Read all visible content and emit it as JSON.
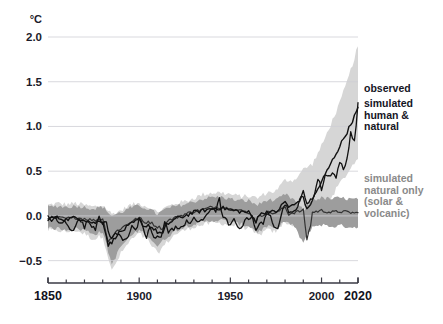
{
  "chart_data": {
    "type": "line",
    "title": "",
    "xlabel": "",
    "ylabel": "°C",
    "unit_label": "°C",
    "xlim": [
      1850,
      2020
    ],
    "ylim": [
      -0.75,
      2.0
    ],
    "grid": true,
    "grid_axis": "y",
    "legend_position": "right-inline",
    "x_ticks_major": [
      1850,
      1900,
      1950,
      2000,
      2020
    ],
    "x_tick_labels": [
      "1850",
      "1900",
      "1950",
      "2000",
      "2020"
    ],
    "x_ticks_minor_step": 10,
    "y_ticks": [
      -0.5,
      0.0,
      0.5,
      1.0,
      1.5,
      2.0
    ],
    "y_tick_labels": [
      "-0.5",
      "0.0",
      "0.5",
      "1.0",
      "1.5",
      "2.0"
    ],
    "colors": {
      "observed_line": "#111111",
      "human_natural_line": "#111111",
      "natural_only_line": "#333333",
      "human_natural_band": "#d6d6d6",
      "natural_only_band": "#9d9d9d",
      "gridline": "#cfcfd6",
      "axis": "#3a3a44",
      "legend_dark_text": "#15151f",
      "legend_gray_text": "#8a8a8a"
    },
    "annotations": [
      {
        "name": "observed",
        "text": "observed",
        "x": 2021,
        "y": 1.28,
        "color": "#15151f"
      },
      {
        "name": "simulated-human-natural",
        "text": "simulated\nhuman &\nnatural",
        "x": 2021,
        "y": 1.1,
        "color": "#15151f"
      },
      {
        "name": "simulated-natural-only",
        "text": "simulated\nnatural only\n(solar &\nvolcanic)",
        "x": 2021,
        "y": 0.15,
        "color": "#8a8a8a"
      }
    ],
    "x": [
      1850,
      1855,
      1860,
      1865,
      1870,
      1875,
      1880,
      1885,
      1890,
      1895,
      1900,
      1905,
      1910,
      1915,
      1920,
      1925,
      1930,
      1935,
      1940,
      1945,
      1950,
      1955,
      1960,
      1965,
      1970,
      1975,
      1980,
      1985,
      1990,
      1995,
      2000,
      2005,
      2010,
      2015,
      2020
    ],
    "series": [
      {
        "name": "observed",
        "label": "observed",
        "values": [
          -0.02,
          -0.05,
          -0.08,
          -0.04,
          -0.12,
          -0.14,
          -0.1,
          -0.22,
          -0.2,
          -0.16,
          -0.05,
          -0.22,
          -0.25,
          -0.08,
          -0.14,
          -0.12,
          -0.04,
          -0.06,
          0.1,
          0.04,
          -0.12,
          -0.1,
          -0.02,
          -0.12,
          0.0,
          -0.06,
          0.14,
          0.06,
          0.26,
          0.28,
          0.3,
          0.54,
          0.62,
          0.9,
          1.26
        ]
      },
      {
        "name": "simulated_human_natural",
        "label": "simulated human & natural",
        "values": [
          -0.03,
          -0.02,
          -0.04,
          -0.02,
          -0.04,
          -0.08,
          -0.05,
          -0.3,
          -0.18,
          -0.1,
          -0.04,
          -0.1,
          -0.18,
          -0.1,
          -0.03,
          0.0,
          0.04,
          0.06,
          0.08,
          0.09,
          0.07,
          0.05,
          0.04,
          0.0,
          0.05,
          0.04,
          0.16,
          0.12,
          0.22,
          0.18,
          0.38,
          0.58,
          0.78,
          0.98,
          1.2
        ]
      },
      {
        "name": "simulated_natural_only",
        "label": "simulated natural only (solar & volcanic)",
        "values": [
          -0.02,
          -0.02,
          -0.03,
          -0.02,
          -0.03,
          -0.05,
          -0.03,
          -0.26,
          -0.14,
          -0.07,
          -0.02,
          -0.06,
          -0.12,
          -0.06,
          -0.02,
          0.02,
          0.05,
          0.07,
          0.1,
          0.1,
          0.08,
          0.06,
          0.04,
          -0.02,
          0.04,
          0.03,
          0.1,
          0.04,
          -0.1,
          0.04,
          0.06,
          0.04,
          0.05,
          0.04,
          0.03
        ]
      }
    ],
    "bands": [
      {
        "name": "human_natural_range",
        "for_series": "simulated_human_natural",
        "color": "#d6d6d6",
        "upper": [
          0.12,
          0.14,
          0.13,
          0.14,
          0.12,
          0.1,
          0.12,
          0.02,
          0.06,
          0.12,
          0.14,
          0.1,
          0.04,
          0.1,
          0.14,
          0.16,
          0.2,
          0.24,
          0.26,
          0.26,
          0.24,
          0.22,
          0.22,
          0.2,
          0.26,
          0.28,
          0.4,
          0.4,
          0.52,
          0.58,
          0.78,
          1.02,
          1.26,
          1.56,
          1.9
        ],
        "lower": [
          -0.16,
          -0.16,
          -0.18,
          -0.16,
          -0.2,
          -0.26,
          -0.22,
          -0.62,
          -0.42,
          -0.28,
          -0.2,
          -0.28,
          -0.42,
          -0.3,
          -0.2,
          -0.16,
          -0.12,
          -0.1,
          -0.08,
          -0.08,
          -0.1,
          -0.12,
          -0.14,
          -0.22,
          -0.16,
          -0.18,
          -0.06,
          -0.12,
          -0.06,
          -0.14,
          0.04,
          0.2,
          0.36,
          0.5,
          0.66
        ]
      },
      {
        "name": "natural_only_range",
        "for_series": "simulated_natural_only",
        "color": "#9d9d9d",
        "upper": [
          0.1,
          0.11,
          0.1,
          0.11,
          0.1,
          0.08,
          0.1,
          0.0,
          0.04,
          0.09,
          0.11,
          0.08,
          0.02,
          0.08,
          0.11,
          0.13,
          0.16,
          0.19,
          0.21,
          0.21,
          0.19,
          0.17,
          0.17,
          0.12,
          0.18,
          0.17,
          0.24,
          0.18,
          0.06,
          0.18,
          0.2,
          0.19,
          0.2,
          0.19,
          0.18
        ],
        "lower": [
          -0.14,
          -0.14,
          -0.15,
          -0.14,
          -0.16,
          -0.2,
          -0.18,
          -0.54,
          -0.34,
          -0.23,
          -0.16,
          -0.22,
          -0.34,
          -0.24,
          -0.16,
          -0.12,
          -0.09,
          -0.07,
          -0.05,
          -0.05,
          -0.07,
          -0.09,
          -0.11,
          -0.18,
          -0.12,
          -0.14,
          -0.06,
          -0.12,
          -0.3,
          -0.12,
          -0.1,
          -0.12,
          -0.11,
          -0.12,
          -0.13
        ]
      }
    ],
    "series_detail": {
      "observed_dense": [
        [
          1850,
          -0.02
        ],
        [
          1852,
          -0.04
        ],
        [
          1854,
          -0.03
        ],
        [
          1856,
          -0.09
        ],
        [
          1858,
          -0.06
        ],
        [
          1860,
          -0.08
        ],
        [
          1862,
          -0.16
        ],
        [
          1864,
          -0.14
        ],
        [
          1866,
          -0.05
        ],
        [
          1868,
          -0.06
        ],
        [
          1870,
          -0.12
        ],
        [
          1872,
          -0.06
        ],
        [
          1874,
          -0.1
        ],
        [
          1876,
          -0.14
        ],
        [
          1878,
          0.02
        ],
        [
          1880,
          -0.1
        ],
        [
          1882,
          -0.08
        ],
        [
          1884,
          -0.24
        ],
        [
          1886,
          -0.22
        ],
        [
          1888,
          -0.2
        ],
        [
          1890,
          -0.24
        ],
        [
          1892,
          -0.26
        ],
        [
          1894,
          -0.22
        ],
        [
          1896,
          -0.1
        ],
        [
          1898,
          -0.18
        ],
        [
          1900,
          -0.05
        ],
        [
          1902,
          -0.14
        ],
        [
          1904,
          -0.24
        ],
        [
          1906,
          -0.12
        ],
        [
          1908,
          -0.26
        ],
        [
          1910,
          -0.24
        ],
        [
          1912,
          -0.22
        ],
        [
          1914,
          -0.06
        ],
        [
          1916,
          -0.18
        ],
        [
          1918,
          -0.16
        ],
        [
          1920,
          -0.12
        ],
        [
          1922,
          -0.16
        ],
        [
          1924,
          -0.12
        ],
        [
          1926,
          -0.04
        ],
        [
          1928,
          -0.08
        ],
        [
          1930,
          -0.04
        ],
        [
          1932,
          -0.06
        ],
        [
          1934,
          -0.04
        ],
        [
          1936,
          -0.04
        ],
        [
          1938,
          0.04
        ],
        [
          1940,
          0.1
        ],
        [
          1942,
          0.06
        ],
        [
          1944,
          0.18
        ],
        [
          1946,
          -0.02
        ],
        [
          1948,
          -0.06
        ],
        [
          1950,
          -0.12
        ],
        [
          1952,
          -0.04
        ],
        [
          1954,
          -0.1
        ],
        [
          1956,
          -0.16
        ],
        [
          1958,
          -0.02
        ],
        [
          1960,
          -0.02
        ],
        [
          1962,
          -0.02
        ],
        [
          1964,
          -0.18
        ],
        [
          1966,
          -0.06
        ],
        [
          1968,
          -0.08
        ],
        [
          1970,
          0.0
        ],
        [
          1972,
          0.0
        ],
        [
          1974,
          -0.1
        ],
        [
          1976,
          -0.12
        ],
        [
          1978,
          0.02
        ],
        [
          1980,
          0.14
        ],
        [
          1982,
          0.06
        ],
        [
          1984,
          0.02
        ],
        [
          1986,
          0.06
        ],
        [
          1988,
          0.2
        ],
        [
          1990,
          0.26
        ],
        [
          1992,
          0.12
        ],
        [
          1994,
          0.2
        ],
        [
          1996,
          0.22
        ],
        [
          1998,
          0.42
        ],
        [
          2000,
          0.3
        ],
        [
          2002,
          0.46
        ],
        [
          2004,
          0.44
        ],
        [
          2006,
          0.5
        ],
        [
          2008,
          0.42
        ],
        [
          2010,
          0.62
        ],
        [
          2012,
          0.5
        ],
        [
          2014,
          0.64
        ],
        [
          2016,
          0.94
        ],
        [
          2018,
          0.82
        ],
        [
          2020,
          1.26
        ]
      ],
      "human_natural_dense": [
        [
          1850,
          -0.03
        ],
        [
          1855,
          -0.02
        ],
        [
          1860,
          -0.04
        ],
        [
          1865,
          -0.02
        ],
        [
          1870,
          -0.04
        ],
        [
          1875,
          -0.08
        ],
        [
          1880,
          -0.05
        ],
        [
          1883,
          -0.32
        ],
        [
          1885,
          -0.3
        ],
        [
          1888,
          -0.2
        ],
        [
          1890,
          -0.18
        ],
        [
          1895,
          -0.1
        ],
        [
          1900,
          -0.04
        ],
        [
          1903,
          -0.12
        ],
        [
          1905,
          -0.1
        ],
        [
          1910,
          -0.18
        ],
        [
          1913,
          -0.2
        ],
        [
          1915,
          -0.1
        ],
        [
          1920,
          -0.03
        ],
        [
          1925,
          0.0
        ],
        [
          1930,
          0.04
        ],
        [
          1935,
          0.06
        ],
        [
          1940,
          0.08
        ],
        [
          1945,
          0.09
        ],
        [
          1950,
          0.07
        ],
        [
          1955,
          0.05
        ],
        [
          1960,
          0.04
        ],
        [
          1964,
          -0.06
        ],
        [
          1965,
          0.0
        ],
        [
          1970,
          0.05
        ],
        [
          1975,
          0.04
        ],
        [
          1980,
          0.16
        ],
        [
          1982,
          0.1
        ],
        [
          1985,
          0.12
        ],
        [
          1990,
          0.22
        ],
        [
          1992,
          0.06
        ],
        [
          1995,
          0.18
        ],
        [
          2000,
          0.38
        ],
        [
          2005,
          0.58
        ],
        [
          2010,
          0.78
        ],
        [
          2015,
          0.98
        ],
        [
          2020,
          1.2
        ]
      ],
      "natural_only_dense": [
        [
          1850,
          -0.02
        ],
        [
          1855,
          -0.02
        ],
        [
          1860,
          -0.03
        ],
        [
          1865,
          -0.02
        ],
        [
          1870,
          -0.03
        ],
        [
          1875,
          -0.05
        ],
        [
          1880,
          -0.03
        ],
        [
          1883,
          -0.28
        ],
        [
          1885,
          -0.24
        ],
        [
          1888,
          -0.16
        ],
        [
          1890,
          -0.14
        ],
        [
          1895,
          -0.07
        ],
        [
          1900,
          -0.02
        ],
        [
          1903,
          -0.08
        ],
        [
          1905,
          -0.06
        ],
        [
          1910,
          -0.12
        ],
        [
          1913,
          -0.14
        ],
        [
          1915,
          -0.06
        ],
        [
          1920,
          -0.02
        ],
        [
          1925,
          0.02
        ],
        [
          1930,
          0.05
        ],
        [
          1935,
          0.07
        ],
        [
          1940,
          0.1
        ],
        [
          1945,
          0.1
        ],
        [
          1950,
          0.08
        ],
        [
          1955,
          0.06
        ],
        [
          1960,
          0.04
        ],
        [
          1964,
          -0.06
        ],
        [
          1965,
          -0.02
        ],
        [
          1970,
          0.04
        ],
        [
          1975,
          0.03
        ],
        [
          1980,
          0.1
        ],
        [
          1982,
          0.02
        ],
        [
          1985,
          0.04
        ],
        [
          1990,
          0.06
        ],
        [
          1992,
          -0.26
        ],
        [
          1994,
          -0.1
        ],
        [
          1995,
          0.04
        ],
        [
          2000,
          0.06
        ],
        [
          2005,
          0.04
        ],
        [
          2010,
          0.05
        ],
        [
          2015,
          0.04
        ],
        [
          2020,
          0.03
        ]
      ]
    }
  },
  "plot_geometry": {
    "left": 48,
    "right": 358,
    "top": 37,
    "bottom": 283
  }
}
